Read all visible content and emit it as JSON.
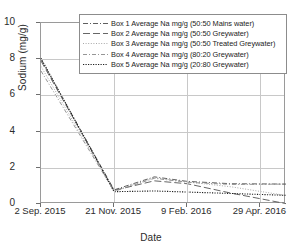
{
  "chart_data": {
    "type": "line",
    "title": "",
    "xlabel": "Date",
    "ylabel": "Sodium (mg/g)",
    "ylim": [
      0,
      10
    ],
    "yticks": [
      0,
      2,
      4,
      6,
      8,
      10
    ],
    "xtick_labels": [
      "2 Sep. 2015",
      "21 Nov. 2015",
      "9 Feb. 2016",
      "29 Apr. 2016"
    ],
    "xtick_positions": [
      0,
      1,
      2,
      3
    ],
    "xlim": [
      0,
      3.35
    ],
    "grid": true,
    "legend_position": "top-right-inside",
    "x": [
      0,
      1,
      1.55,
      2,
      2.6,
      3.35
    ],
    "series": [
      {
        "name": "Box 1 Average Na mg/g (50:50 Mains water)",
        "dash_style": "dash-dot",
        "color": "#4d4d4d",
        "values": [
          8.0,
          0.78,
          1.5,
          1.25,
          1.12,
          1.1
        ]
      },
      {
        "name": "Box 2 Average Na mg/g (50:50 Greywater)",
        "dash_style": "long-dash",
        "color": "#555555",
        "values": [
          7.9,
          0.75,
          1.28,
          1.12,
          0.6,
          0.02
        ]
      },
      {
        "name": "Box 3 Average Na mg/g (50:50 Treated Greywater)",
        "dash_style": "fine-dot",
        "color": "#9e9e9e",
        "values": [
          7.6,
          0.72,
          1.45,
          1.22,
          0.95,
          0.47
        ]
      },
      {
        "name": "Box 4 Average Na mg/g (80:20 Greywater)",
        "dash_style": "dash-dot-light",
        "color": "#8a8a8a",
        "values": [
          7.35,
          0.7,
          1.42,
          1.2,
          1.08,
          1.1
        ]
      },
      {
        "name": "Box 5 Average Na mg/g (20:80 Greywater)",
        "dash_style": "dot",
        "color": "#1f1f1f",
        "values": [
          8.05,
          0.68,
          0.72,
          0.66,
          0.58,
          0.48
        ]
      }
    ]
  }
}
